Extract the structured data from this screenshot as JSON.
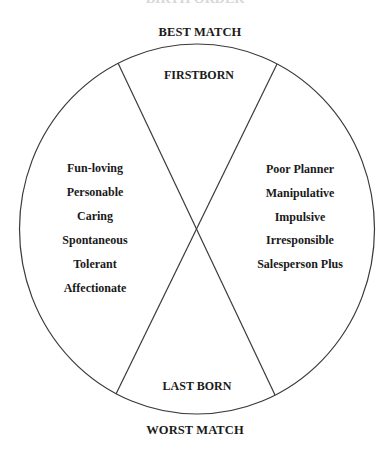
{
  "diagram": {
    "top_cut_title": "BIRTH ORDER",
    "outer_top_label": "BEST MATCH",
    "outer_bottom_label": "WORST MATCH",
    "segments": {
      "top": {
        "label": "FIRSTBORN"
      },
      "bottom": {
        "label": "LAST BORN"
      },
      "left": {
        "traits": [
          "Fun-loving",
          "Personable",
          "Caring",
          "Spontaneous",
          "Tolerant",
          "Affectionate"
        ]
      },
      "right": {
        "traits": [
          "Poor Planner",
          "Manipulative",
          "Impulsive",
          "Irresponsible",
          "Salesperson Plus"
        ]
      }
    },
    "colors": {
      "line": "#3a3a3a",
      "text": "#1a1a1a",
      "background": "#ffffff"
    }
  }
}
